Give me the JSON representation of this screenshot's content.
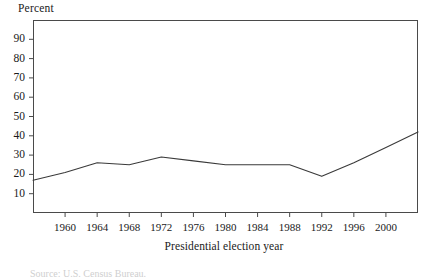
{
  "figure": {
    "y_unit_label": "Percent",
    "x_axis_title": "Presidential election year",
    "source_caption": "Source: U.S. Census Bureau."
  },
  "chart_data": {
    "type": "line",
    "title": "",
    "xlabel": "Presidential election year",
    "ylabel": "Percent",
    "ylim": [
      0,
      100
    ],
    "xlim": [
      1956,
      2004
    ],
    "grid": false,
    "legend": "none",
    "y_ticks": [
      10,
      20,
      30,
      40,
      50,
      60,
      70,
      80,
      90
    ],
    "x_ticks": [
      1960,
      1964,
      1968,
      1972,
      1976,
      1980,
      1984,
      1988,
      1992,
      1996,
      2000
    ],
    "line_color": "#3a3a3a",
    "x": [
      1956,
      1960,
      1964,
      1968,
      1972,
      1976,
      1980,
      1984,
      1988,
      1992,
      1996,
      2000,
      2004
    ],
    "values": [
      17,
      21,
      26,
      25,
      29,
      27,
      25,
      25,
      25,
      19,
      26,
      34,
      42
    ],
    "series": [
      {
        "name": "Percent",
        "values": [
          17,
          21,
          26,
          25,
          29,
          27,
          25,
          25,
          25,
          19,
          26,
          34,
          42
        ]
      }
    ]
  }
}
